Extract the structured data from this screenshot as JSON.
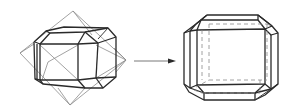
{
  "diagram": {
    "description": "Crystal habit transformation: a truncated polyhedron inscribed in an octahedron transforms into a truncated cube (cube with beveled edges and corners)",
    "left_figure": {
      "name": "polyhedron-inscribed-in-octahedron",
      "outer_shape": "octahedron (thin gray lines)",
      "inner_shape": "truncated polyhedron (thick dark lines)"
    },
    "arrow": {
      "direction": "right",
      "meaning": "transforms into"
    },
    "right_figure": {
      "name": "truncated-cube",
      "visible_edges": "solid",
      "hidden_edges": "dashed"
    },
    "colors": {
      "background": "#ffffff",
      "thick_line": "#2a2a2a",
      "thin_line": "#8a8a8a",
      "arrow": "#6a6a6a"
    }
  }
}
